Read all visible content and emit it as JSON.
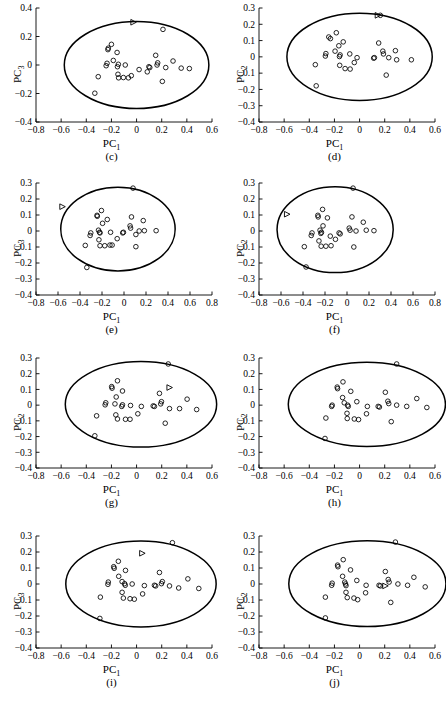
{
  "figure": {
    "type": "multi-panel-scatter",
    "panel_count": 8,
    "marker_style": "open-circle",
    "special_marker_style": "right-triangle",
    "boundary_style": "ellipse",
    "line_color": "#000000"
  },
  "chart_data": [
    {
      "type": "scatter",
      "panel": "(c)",
      "title": "",
      "xlabel": "PC",
      "xlabel_sub": "1",
      "ylabel": "PC",
      "ylabel_sub": "3",
      "xlim": [
        -0.8,
        0.6
      ],
      "ylim": [
        -0.4,
        0.4
      ],
      "xticks": [
        "-0.8",
        "-0.6",
        "-0.4",
        "-0.2",
        "0",
        "0.2",
        "0.4",
        "0.6"
      ],
      "yticks": [
        "0.4",
        "0.2",
        "0",
        "-0.2",
        "-0.4"
      ],
      "grid": false,
      "legend": "none",
      "ellipse": {
        "cx": 0.0,
        "cy": 0.0,
        "rx": 0.575,
        "ry": 0.305
      },
      "points": [
        [
          0.21,
          0.25
        ],
        [
          -0.2,
          0.145
        ],
        [
          -0.225,
          0.118
        ],
        [
          -0.228,
          0.108
        ],
        [
          -0.155,
          0.088
        ],
        [
          -0.235,
          0.012
        ],
        [
          -0.242,
          -0.005
        ],
        [
          -0.185,
          0.032
        ],
        [
          -0.145,
          0.005
        ],
        [
          -0.152,
          -0.012
        ],
        [
          -0.09,
          0.0
        ],
        [
          -0.305,
          -0.082
        ],
        [
          -0.148,
          -0.065
        ],
        [
          -0.143,
          -0.09
        ],
        [
          -0.105,
          -0.088
        ],
        [
          -0.065,
          -0.09
        ],
        [
          -0.042,
          -0.075
        ],
        [
          0.02,
          -0.032
        ],
        [
          0.085,
          -0.048
        ],
        [
          0.098,
          -0.012
        ],
        [
          0.105,
          -0.018
        ],
        [
          0.152,
          0.068
        ],
        [
          0.168,
          0.015
        ],
        [
          0.163,
          0.0
        ],
        [
          0.232,
          -0.018
        ],
        [
          0.29,
          0.028
        ],
        [
          0.355,
          -0.022
        ],
        [
          0.42,
          -0.025
        ],
        [
          0.205,
          -0.115
        ],
        [
          -0.332,
          -0.198
        ]
      ],
      "special_points": [
        [
          -0.025,
          0.3
        ]
      ]
    },
    {
      "type": "scatter",
      "panel": "(d)",
      "title": "",
      "xlabel": "PC",
      "xlabel_sub": "1",
      "ylabel": "PC",
      "ylabel_sub": "2",
      "xlim": [
        -0.8,
        0.6
      ],
      "ylim": [
        -0.4,
        0.3
      ],
      "xticks": [
        "-0.8",
        "-0.6",
        "-0.4",
        "-0.2",
        "0",
        "0.2",
        "0.4",
        "0.6"
      ],
      "yticks": [
        "0.3",
        "0.2",
        "0.1",
        "0",
        "-0.1",
        "-0.2",
        "-0.3",
        "-0.4"
      ],
      "grid": false,
      "legend": "none",
      "ellipse": {
        "cx": 0.0,
        "cy": 0.0,
        "rx": 0.578,
        "ry": 0.268
      },
      "points": [
        [
          0.165,
          0.255
        ],
        [
          -0.185,
          0.148
        ],
        [
          -0.245,
          0.122
        ],
        [
          -0.232,
          0.112
        ],
        [
          -0.13,
          0.092
        ],
        [
          -0.165,
          0.068
        ],
        [
          -0.268,
          0.02
        ],
        [
          -0.272,
          0.005
        ],
        [
          -0.195,
          0.035
        ],
        [
          -0.155,
          0.012
        ],
        [
          -0.16,
          0.002
        ],
        [
          -0.078,
          0.018
        ],
        [
          -0.352,
          -0.048
        ],
        [
          -0.158,
          -0.052
        ],
        [
          -0.115,
          -0.072
        ],
        [
          -0.075,
          -0.075
        ],
        [
          -0.042,
          -0.035
        ],
        [
          -0.02,
          -0.005
        ],
        [
          0.112,
          -0.008
        ],
        [
          0.118,
          -0.005
        ],
        [
          0.152,
          0.085
        ],
        [
          0.185,
          0.035
        ],
        [
          0.19,
          0.018
        ],
        [
          0.232,
          -0.005
        ],
        [
          0.285,
          0.038
        ],
        [
          0.295,
          -0.018
        ],
        [
          0.412,
          -0.018
        ],
        [
          0.212,
          -0.112
        ],
        [
          -0.345,
          -0.178
        ]
      ],
      "special_points": [
        [
          0.145,
          0.255
        ]
      ]
    },
    {
      "type": "scatter",
      "panel": "(e)",
      "title": "",
      "xlabel": "PC",
      "xlabel_sub": "1",
      "ylabel": "PC",
      "ylabel_sub": "3",
      "xlim": [
        -0.8,
        0.8
      ],
      "ylim": [
        -0.4,
        0.3
      ],
      "xticks": [
        "-0.8",
        "-0.6",
        "-0.4",
        "-0.2",
        "0",
        "0.2",
        "0.4",
        "0.6",
        "0.8"
      ],
      "yticks": [
        "0.3",
        "0.2",
        "0.1",
        "0",
        "-0.1",
        "-0.2",
        "-0.3",
        "-0.4"
      ],
      "grid": false,
      "legend": "none",
      "ellipse": {
        "cx": -0.055,
        "cy": 0.012,
        "rx": 0.52,
        "ry": 0.262
      },
      "points": [
        [
          0.082,
          0.268
        ],
        [
          -0.205,
          0.128
        ],
        [
          -0.245,
          0.098
        ],
        [
          -0.243,
          0.092
        ],
        [
          -0.152,
          0.072
        ],
        [
          -0.195,
          0.048
        ],
        [
          -0.302,
          -0.012
        ],
        [
          -0.308,
          -0.028
        ],
        [
          -0.232,
          0.005
        ],
        [
          -0.222,
          -0.008
        ],
        [
          -0.218,
          -0.012
        ],
        [
          -0.122,
          -0.008
        ],
        [
          -0.352,
          -0.09
        ],
        [
          -0.228,
          -0.055
        ],
        [
          -0.218,
          -0.092
        ],
        [
          -0.175,
          -0.092
        ],
        [
          -0.128,
          -0.088
        ],
        [
          -0.108,
          -0.088
        ],
        [
          -0.062,
          -0.048
        ],
        [
          -0.012,
          -0.012
        ],
        [
          -0.005,
          -0.008
        ],
        [
          0.068,
          0.088
        ],
        [
          0.055,
          0.032
        ],
        [
          0.06,
          0.018
        ],
        [
          0.108,
          -0.022
        ],
        [
          0.175,
          0.065
        ],
        [
          0.138,
          0.0
        ],
        [
          0.185,
          0.002
        ],
        [
          0.292,
          0.002
        ],
        [
          0.108,
          -0.098
        ],
        [
          -0.338,
          -0.228
        ]
      ],
      "special_points": [
        [
          -0.56,
          0.152
        ]
      ]
    },
    {
      "type": "scatter",
      "panel": "(f)",
      "title": "",
      "xlabel": "PC",
      "xlabel_sub": "1",
      "ylabel": "PC",
      "ylabel_sub": "2",
      "xlim": [
        -0.8,
        0.8
      ],
      "ylim": [
        -0.4,
        0.3
      ],
      "xticks": [
        "-0.8",
        "-0.6",
        "-0.4",
        "-0.2",
        "0",
        "0.2",
        "0.4",
        "0.6",
        "0.8"
      ],
      "yticks": [
        "0.3",
        "0.2",
        "0.1",
        "0",
        "-0.1",
        "-0.2",
        "-0.3",
        "-0.4"
      ],
      "grid": false,
      "legend": "none",
      "ellipse": {
        "cx": -0.108,
        "cy": 0.008,
        "rx": 0.528,
        "ry": 0.268
      },
      "points": [
        [
          0.055,
          0.268
        ],
        [
          -0.222,
          0.135
        ],
        [
          -0.265,
          0.098
        ],
        [
          -0.262,
          0.088
        ],
        [
          -0.178,
          0.082
        ],
        [
          -0.218,
          0.032
        ],
        [
          -0.318,
          -0.012
        ],
        [
          -0.325,
          -0.028
        ],
        [
          -0.245,
          0.005
        ],
        [
          -0.232,
          -0.008
        ],
        [
          -0.238,
          -0.015
        ],
        [
          -0.152,
          -0.032
        ],
        [
          -0.388,
          -0.098
        ],
        [
          -0.255,
          -0.062
        ],
        [
          -0.235,
          -0.095
        ],
        [
          -0.192,
          -0.095
        ],
        [
          -0.145,
          -0.092
        ],
        [
          -0.105,
          -0.052
        ],
        [
          -0.072,
          -0.012
        ],
        [
          -0.062,
          -0.018
        ],
        [
          0.045,
          0.088
        ],
        [
          0.02,
          0.018
        ],
        [
          0.028,
          0.005
        ],
        [
          0.082,
          0.0
        ],
        [
          0.148,
          0.055
        ],
        [
          0.175,
          0.005
        ],
        [
          0.245,
          0.002
        ],
        [
          0.062,
          -0.1
        ],
        [
          -0.372,
          -0.225
        ]
      ],
      "special_points": [
        [
          -0.545,
          0.105
        ]
      ]
    },
    {
      "type": "scatter",
      "panel": "(g)",
      "title": "",
      "xlabel": "PC",
      "xlabel_sub": "1",
      "ylabel": "PC",
      "ylabel_sub": "2",
      "xlim": [
        -0.8,
        0.6
      ],
      "ylim": [
        -0.4,
        0.3
      ],
      "xticks": [
        "-0.8",
        "-0.6",
        "-0.4",
        "-0.2",
        "0",
        "0.2",
        "0.4",
        "0.6"
      ],
      "yticks": [
        "0.3",
        "0.2",
        "0.1",
        "0",
        "-0.1",
        "-0.2",
        "-0.3",
        "-0.4"
      ],
      "grid": false,
      "legend": "none",
      "ellipse": {
        "cx": 0.035,
        "cy": 0.005,
        "rx": 0.602,
        "ry": 0.272
      },
      "points": [
        [
          0.252,
          0.262
        ],
        [
          -0.152,
          0.155
        ],
        [
          -0.198,
          0.118
        ],
        [
          -0.195,
          0.108
        ],
        [
          -0.112,
          0.09
        ],
        [
          -0.162,
          0.052
        ],
        [
          -0.245,
          0.015
        ],
        [
          -0.25,
          0.002
        ],
        [
          -0.172,
          0.008
        ],
        [
          -0.112,
          0.002
        ],
        [
          -0.118,
          -0.008
        ],
        [
          -0.048,
          -0.002
        ],
        [
          -0.318,
          -0.068
        ],
        [
          -0.165,
          -0.062
        ],
        [
          -0.152,
          -0.088
        ],
        [
          -0.088,
          -0.09
        ],
        [
          -0.052,
          -0.09
        ],
        [
          0.01,
          -0.055
        ],
        [
          0.038,
          -0.008
        ],
        [
          0.132,
          -0.005
        ],
        [
          0.142,
          -0.008
        ],
        [
          0.182,
          0.075
        ],
        [
          0.198,
          0.022
        ],
        [
          0.192,
          0.008
        ],
        [
          0.262,
          -0.022
        ],
        [
          0.342,
          -0.022
        ],
        [
          0.402,
          0.038
        ],
        [
          0.478,
          -0.028
        ],
        [
          0.228,
          -0.115
        ],
        [
          -0.332,
          -0.195
        ]
      ],
      "special_points": [
        [
          0.262,
          0.112
        ]
      ]
    },
    {
      "type": "scatter",
      "panel": "(h)",
      "title": "",
      "xlabel": "PC",
      "xlabel_sub": "1",
      "ylabel": "PC",
      "ylabel_sub": "2",
      "xlim": [
        -0.8,
        0.6
      ],
      "ylim": [
        -0.4,
        0.3
      ],
      "xticks": [
        "-0.8",
        "-0.6",
        "-0.4",
        "-0.2",
        "0",
        "0.2",
        "0.4",
        "0.6"
      ],
      "yticks": [
        "0.3",
        "0.2",
        "0.1",
        "0",
        "-0.1",
        "-0.2",
        "-0.3",
        "-0.4"
      ],
      "grid": false,
      "legend": "none",
      "ellipse": {
        "cx": 0.058,
        "cy": 0.005,
        "rx": 0.625,
        "ry": 0.268
      },
      "points": [
        [
          0.295,
          0.262
        ],
        [
          -0.132,
          0.148
        ],
        [
          -0.178,
          0.115
        ],
        [
          -0.175,
          0.105
        ],
        [
          -0.07,
          0.088
        ],
        [
          -0.135,
          0.048
        ],
        [
          -0.218,
          0.0
        ],
        [
          -0.222,
          -0.008
        ],
        [
          -0.122,
          0.015
        ],
        [
          -0.095,
          0.0
        ],
        [
          -0.09,
          -0.008
        ],
        [
          -0.022,
          0.022
        ],
        [
          -0.268,
          -0.082
        ],
        [
          -0.1,
          -0.052
        ],
        [
          -0.098,
          -0.085
        ],
        [
          -0.042,
          -0.088
        ],
        [
          -0.008,
          -0.092
        ],
        [
          0.055,
          -0.055
        ],
        [
          0.062,
          -0.008
        ],
        [
          0.148,
          -0.008
        ],
        [
          0.158,
          -0.012
        ],
        [
          0.205,
          0.082
        ],
        [
          0.225,
          0.025
        ],
        [
          0.232,
          0.01
        ],
        [
          0.295,
          0.0
        ],
        [
          0.375,
          -0.008
        ],
        [
          0.455,
          0.042
        ],
        [
          0.535,
          -0.015
        ],
        [
          0.252,
          -0.105
        ],
        [
          -0.275,
          -0.212
        ]
      ],
      "special_points": []
    },
    {
      "type": "scatter",
      "panel": "(i)",
      "title": "",
      "xlabel": "PC",
      "xlabel_sub": "1",
      "ylabel": "PC",
      "ylabel_sub": "3",
      "xlim": [
        -0.8,
        0.6
      ],
      "ylim": [
        -0.4,
        0.3
      ],
      "xticks": [
        "-0.8",
        "-0.6",
        "-0.4",
        "-0.2",
        "0",
        "0.2",
        "0.4",
        "0.6"
      ],
      "yticks": [
        "0.3",
        "0.2",
        "0.1",
        "0",
        "-0.1",
        "-0.2",
        "-0.3",
        "-0.4"
      ],
      "grid": false,
      "legend": "none",
      "ellipse": {
        "cx": 0.035,
        "cy": 0.0,
        "rx": 0.598,
        "ry": 0.268
      },
      "points": [
        [
          0.285,
          0.258
        ],
        [
          -0.145,
          0.142
        ],
        [
          -0.182,
          0.108
        ],
        [
          -0.178,
          0.098
        ],
        [
          -0.088,
          0.085
        ],
        [
          -0.142,
          0.048
        ],
        [
          -0.225,
          0.012
        ],
        [
          -0.228,
          -0.002
        ],
        [
          -0.115,
          0.015
        ],
        [
          -0.095,
          0.002
        ],
        [
          -0.09,
          -0.008
        ],
        [
          -0.035,
          0.0
        ],
        [
          -0.288,
          -0.082
        ],
        [
          -0.115,
          -0.052
        ],
        [
          -0.105,
          -0.088
        ],
        [
          -0.052,
          -0.092
        ],
        [
          -0.018,
          -0.095
        ],
        [
          0.048,
          -0.062
        ],
        [
          0.062,
          -0.01
        ],
        [
          0.142,
          -0.008
        ],
        [
          0.152,
          -0.012
        ],
        [
          0.182,
          0.072
        ],
        [
          0.205,
          0.015
        ],
        [
          0.198,
          0.002
        ],
        [
          0.262,
          -0.012
        ],
        [
          0.335,
          -0.025
        ],
        [
          0.408,
          0.032
        ],
        [
          0.495,
          -0.028
        ],
        [
          -0.292,
          -0.215
        ]
      ],
      "special_points": [
        [
          0.045,
          0.192
        ]
      ]
    },
    {
      "type": "scatter",
      "panel": "(j)",
      "title": "",
      "xlabel": "PC",
      "xlabel_sub": "1",
      "ylabel": "PC",
      "ylabel_sub": "2",
      "xlim": [
        -0.8,
        0.6
      ],
      "ylim": [
        -0.4,
        0.3
      ],
      "xticks": [
        "-0.8",
        "-0.6",
        "-0.4",
        "-0.2",
        "0",
        "0.2",
        "0.4",
        "0.6"
      ],
      "yticks": [
        "0.3",
        "0.2",
        "0.1",
        "0",
        "-0.1",
        "-0.2",
        "-0.3",
        "-0.4"
      ],
      "grid": false,
      "legend": "none",
      "ellipse": {
        "cx": 0.062,
        "cy": 0.002,
        "rx": 0.625,
        "ry": 0.268
      },
      "points": [
        [
          0.285,
          0.262
        ],
        [
          -0.13,
          0.152
        ],
        [
          -0.175,
          0.118
        ],
        [
          -0.172,
          0.108
        ],
        [
          -0.072,
          0.088
        ],
        [
          -0.135,
          0.048
        ],
        [
          -0.218,
          0.005
        ],
        [
          -0.222,
          -0.008
        ],
        [
          -0.118,
          0.012
        ],
        [
          -0.112,
          0.0
        ],
        [
          -0.108,
          -0.01
        ],
        [
          -0.022,
          0.022
        ],
        [
          -0.272,
          -0.082
        ],
        [
          -0.108,
          -0.052
        ],
        [
          -0.098,
          -0.085
        ],
        [
          -0.045,
          -0.088
        ],
        [
          -0.015,
          -0.098
        ],
        [
          0.048,
          -0.055
        ],
        [
          0.052,
          -0.008
        ],
        [
          0.155,
          -0.008
        ],
        [
          0.165,
          -0.012
        ],
        [
          0.205,
          0.078
        ],
        [
          0.228,
          0.028
        ],
        [
          0.235,
          0.012
        ],
        [
          0.305,
          0.0
        ],
        [
          0.382,
          -0.008
        ],
        [
          0.432,
          0.042
        ],
        [
          0.522,
          -0.018
        ],
        [
          0.248,
          -0.115
        ],
        [
          -0.272,
          -0.212
        ]
      ],
      "special_points": [
        [
          0.205,
          -0.012
        ]
      ]
    }
  ]
}
